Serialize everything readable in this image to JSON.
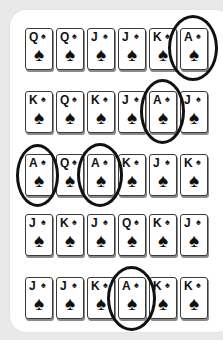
{
  "suit_symbol": "♠",
  "rows": [
    {
      "cards": [
        "Q",
        "Q",
        "J",
        "J",
        "K",
        "A"
      ]
    },
    {
      "cards": [
        "K",
        "Q",
        "K",
        "J",
        "A",
        "J"
      ]
    },
    {
      "cards": [
        "A",
        "Q",
        "A",
        "K",
        "J",
        "K"
      ]
    },
    {
      "cards": [
        "J",
        "K",
        "J",
        "Q",
        "K",
        "J"
      ]
    },
    {
      "cards": [
        "J",
        "J",
        "K",
        "A",
        "K",
        "K"
      ]
    }
  ],
  "circled": [
    {
      "row": 1,
      "col": 6,
      "rank": "A"
    },
    {
      "row": 2,
      "col": 5,
      "rank": "A"
    },
    {
      "row": 3,
      "col": 1,
      "rank": "A"
    },
    {
      "row": 3,
      "col": 3,
      "rank": "A"
    },
    {
      "row": 5,
      "col": 4,
      "rank": "A"
    }
  ],
  "colors": {
    "background": "#e9e9e9",
    "panel": "#ffffff",
    "card_border": "#3a3a3a",
    "ink": "#111111"
  }
}
